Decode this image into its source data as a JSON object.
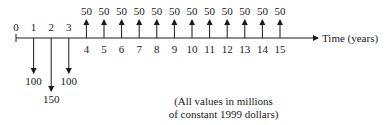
{
  "diagram": {
    "type": "cash-flow-diagram",
    "axis_label": "Time (years)",
    "note_line1": "(All values in millions",
    "note_line2": "of constant 1999 dollars)",
    "periods": [
      "0",
      "1",
      "2",
      "3",
      "4",
      "5",
      "6",
      "7",
      "8",
      "9",
      "10",
      "11",
      "12",
      "13",
      "14",
      "15"
    ],
    "outflows": [
      {
        "period": 1,
        "value": "100"
      },
      {
        "period": 2,
        "value": "150"
      },
      {
        "period": 3,
        "value": "100"
      }
    ],
    "inflows": [
      {
        "period": 4,
        "value": "50"
      },
      {
        "period": 5,
        "value": "50"
      },
      {
        "period": 6,
        "value": "50"
      },
      {
        "period": 7,
        "value": "50"
      },
      {
        "period": 8,
        "value": "50"
      },
      {
        "period": 9,
        "value": "50"
      },
      {
        "period": 10,
        "value": "50"
      },
      {
        "period": 11,
        "value": "50"
      },
      {
        "period": 12,
        "value": "50"
      },
      {
        "period": 13,
        "value": "50"
      },
      {
        "period": 14,
        "value": "50"
      },
      {
        "period": 15,
        "value": "50"
      }
    ]
  }
}
